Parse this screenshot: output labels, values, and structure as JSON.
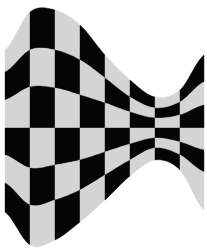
{
  "graphic": {
    "subject": "waving checkered flag",
    "colors": {
      "dark": "#050505",
      "light": "#d4d4d4",
      "background": "#ffffff"
    },
    "columns": 8,
    "rows": 6,
    "top_left_cell": "light",
    "column_x": [
      5,
      30,
      55,
      80,
      105,
      130,
      155,
      180,
      204
    ],
    "row_boundaries_y_by_column": [
      [
        50,
        72,
        100,
        128,
        155,
        183,
        212
      ],
      [
        12,
        50,
        87,
        128,
        168,
        205,
        245
      ],
      [
        10,
        50,
        88,
        128,
        165,
        200,
        240
      ],
      [
        25,
        60,
        95,
        128,
        160,
        190,
        222
      ],
      [
        55,
        78,
        103,
        128,
        152,
        175,
        200
      ],
      [
        80,
        97,
        112,
        128,
        144,
        160,
        176
      ],
      [
        97,
        108,
        118,
        128,
        138,
        148,
        160
      ],
      [
        90,
        102,
        115,
        128,
        142,
        155,
        170
      ],
      [
        55,
        82,
        105,
        128,
        150,
        172,
        210
      ]
    ]
  }
}
